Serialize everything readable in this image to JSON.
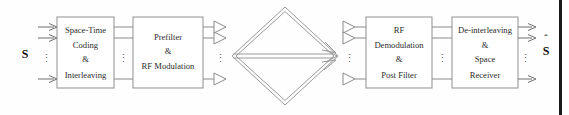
{
  "figure": {
    "name": "mimo-space-time-system-block-diagram",
    "background_color": "#fefefe",
    "line_color": "#8a8a8a",
    "text_color": "#2b2b2b"
  },
  "input": {
    "symbol": "S",
    "label_name": "input-signal-symbol",
    "arrow_count": 3,
    "dots": "⋮"
  },
  "output": {
    "symbol": "S",
    "hat": "ˆ",
    "label_name": "output-signal-symbol",
    "arrow_count": 3,
    "dots": "⋮"
  },
  "blocks": [
    {
      "id": "space-time-coding-interleaving",
      "lines": [
        "Space-Time",
        "Coding",
        "&",
        "Interleaving"
      ],
      "x": 57,
      "y": 17,
      "width": 57,
      "height": 71
    },
    {
      "id": "prefilter-rf-modulation",
      "lines": [
        "Prefilter",
        "&",
        "RF Modulation"
      ],
      "x": 133,
      "y": 17,
      "width": 70,
      "height": 71
    },
    {
      "id": "rf-demodulation-post-filter",
      "lines": [
        "RF",
        "Demodulation",
        "&",
        "Post Filter"
      ],
      "x": 366,
      "y": 17,
      "width": 66,
      "height": 71
    },
    {
      "id": "de-interleaving-space-receiver",
      "lines": [
        "De-interleaving",
        "&",
        "Space",
        "Receiver"
      ],
      "x": 452,
      "y": 17,
      "width": 66,
      "height": 71
    }
  ],
  "connections": {
    "stage1_to_stage2_lines": 3,
    "stage3_to_stage4_lines": 3,
    "dots_between_lines": "⋮"
  },
  "antennas": {
    "transmit_count": 3,
    "transmit_label": "transmit-antenna",
    "receive_count": 3,
    "receive_label": "receive-antenna",
    "dots": "⋮"
  },
  "channel": {
    "name": "wireless-multipath-channel",
    "shape": "diamond",
    "path_arrows": 3,
    "description": "Multipath propagation paths between transmit and receive antenna arrays"
  }
}
